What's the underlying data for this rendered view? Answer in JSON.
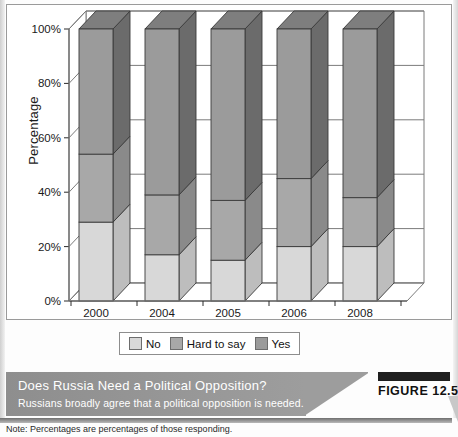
{
  "figure": {
    "bar_label": "FIGURE 12.5",
    "caption_title": "Does Russia Need a Political Opposition?",
    "caption_subtitle": "Russians broadly agree that a political opposition is needed.",
    "note": "Note: Percentages are percentages of those responding."
  },
  "colors": {
    "no_front": "#d8d8d8",
    "no_side": "#bdbdbd",
    "no_top": "#ececec",
    "hard_front": "#a8a8a8",
    "hard_side": "#8a8a8a",
    "hard_top": "#bdbdbd",
    "yes_front": "#9b9b9b",
    "yes_side": "#6b6b6b",
    "yes_top": "#7e7e7e",
    "outline": "#3a3a3a",
    "axis": "#7b7b7b",
    "caption_band": "#9d9d9d",
    "figure_bar": "#1f1f1f"
  },
  "chart_data": {
    "type": "bar",
    "subtype": "stacked-3d-column",
    "title": "Does Russia Need a Political Opposition?",
    "xlabel": "",
    "ylabel": "Percentage",
    "ylim": [
      0,
      100
    ],
    "yticks": [
      "0%",
      "20%",
      "40%",
      "60%",
      "80%",
      "100%"
    ],
    "ytick_values": [
      0,
      20,
      40,
      60,
      80,
      100
    ],
    "grid": false,
    "legend_position": "bottom",
    "categories": [
      "2000",
      "2004",
      "2005",
      "2006",
      "2008"
    ],
    "series": [
      {
        "name": "No",
        "values": [
          29,
          17,
          15,
          20,
          20
        ]
      },
      {
        "name": "Hard to say",
        "values": [
          25,
          22,
          22,
          25,
          18
        ]
      },
      {
        "name": "Yes",
        "values": [
          46,
          61,
          63,
          55,
          62
        ]
      }
    ],
    "stack_order_bottom_to_top": [
      "No",
      "Hard to say",
      "Yes"
    ]
  }
}
